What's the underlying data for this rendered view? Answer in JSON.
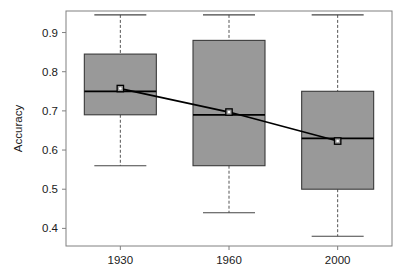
{
  "chart_data": {
    "type": "box",
    "title": "",
    "xlabel": "",
    "ylabel": "Accuracy",
    "categories": [
      "1930",
      "1960",
      "2000"
    ],
    "ylim": [
      0.355,
      0.955
    ],
    "yticks": [
      0.4,
      0.5,
      0.6,
      0.7,
      0.8,
      0.9
    ],
    "ytick_labels": [
      "0.4",
      "0.5",
      "0.6",
      "0.7",
      "0.8",
      "0.9"
    ],
    "grid": false,
    "legend": null,
    "box_fill": "#999999",
    "box_stroke": "#000000",
    "whisker_style": "dashed",
    "boxes": [
      {
        "category": "1930",
        "whisker_high": 0.945,
        "q3": 0.845,
        "median": 0.75,
        "q1": 0.69,
        "whisker_low": 0.56,
        "mean": 0.757
      },
      {
        "category": "1960",
        "whisker_high": 0.945,
        "q3": 0.88,
        "median": 0.69,
        "q1": 0.56,
        "whisker_low": 0.44,
        "mean": 0.697
      },
      {
        "category": "2000",
        "whisker_high": 0.945,
        "q3": 0.75,
        "median": 0.63,
        "q1": 0.5,
        "whisker_low": 0.38,
        "mean": 0.623
      }
    ],
    "mean_series": {
      "name": "mean",
      "x": [
        "1930",
        "1960",
        "2000"
      ],
      "values": [
        0.757,
        0.697,
        0.623
      ],
      "line_color": "#000000",
      "marker": "circle-dot"
    }
  }
}
